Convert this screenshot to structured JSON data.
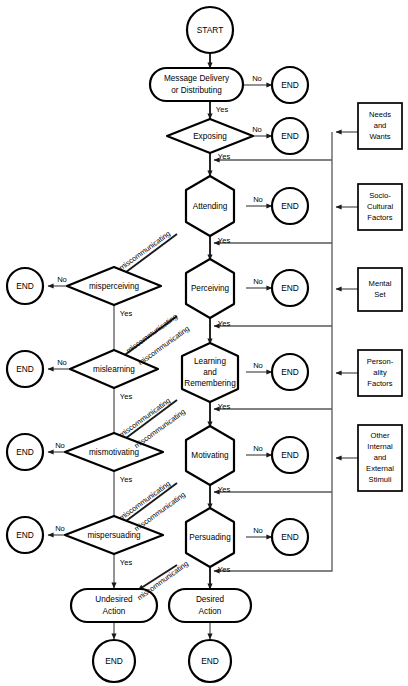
{
  "diagram": {
    "terminators": {
      "start_label": "START",
      "end_label": "END"
    },
    "answers": {
      "yes": "Yes",
      "no": "No"
    },
    "miscommunicating_label": "miscommunicating",
    "nodes": {
      "start": "START",
      "message_delivery": "Message Delivery\nor Distributing",
      "exposing": "Exposing",
      "attending": "Attending",
      "perceiving": "Perceiving",
      "learning": "Learning\nand\nRemembering",
      "motivating": "Motivating",
      "persuading": "Persuading",
      "misperceiving": "misperceiving",
      "mislearning": "mislearning",
      "mismotivating": "mismotivating",
      "mispersuading": "mispersuading",
      "undesired_action": "Undesired\nAction",
      "desired_action": "Desired\nAction"
    },
    "node_text": {
      "start": "START",
      "message_line1": "Message Delivery",
      "message_line2": "or Distributing",
      "exposing": "Exposing",
      "attending": "Attending",
      "perceiving": "Perceiving",
      "learning_line1": "Learning",
      "learning_line2": "and",
      "learning_line3": "Remembering",
      "motivating": "Motivating",
      "persuading": "Persuading",
      "misperceiving": "misperceiving",
      "mislearning": "mislearning",
      "mismotivating": "mismotivating",
      "mispersuading": "mispersuading",
      "undesired_line1": "Undesired",
      "undesired_line2": "Action",
      "desired_line1": "Desired",
      "desired_line2": "Action"
    },
    "side_boxes": [
      {
        "id": "needs-wants",
        "lines": [
          "Needs",
          "and",
          "Wants"
        ]
      },
      {
        "id": "socio-cultural",
        "lines": [
          "Socio-",
          "Cultural",
          "Factors"
        ]
      },
      {
        "id": "mental-set",
        "lines": [
          "Mental",
          "Set"
        ]
      },
      {
        "id": "personality",
        "lines": [
          "Person-",
          "ality",
          "Factors"
        ]
      },
      {
        "id": "other-stimuli",
        "lines": [
          "Other",
          "Internal",
          "and",
          "External",
          "Stimuli"
        ]
      }
    ],
    "side_box_text": {
      "b0l0": "Needs",
      "b0l1": "and",
      "b0l2": "Wants",
      "b1l0": "Socio-",
      "b1l1": "Cultural",
      "b1l2": "Factors",
      "b2l0": "Mental",
      "b2l1": "Set",
      "b3l0": "Person-",
      "b3l1": "ality",
      "b3l2": "Factors",
      "b4l0": "Other",
      "b4l1": "Internal",
      "b4l2": "and",
      "b4l3": "External",
      "b4l4": "Stimuli"
    },
    "end_labels": {
      "e1": "END",
      "e2": "END",
      "e3": "END",
      "e4": "END",
      "e5": "END",
      "e6": "END",
      "l1": "END",
      "l2": "END",
      "l3": "END",
      "l4": "END",
      "b1": "END",
      "b2": "END"
    },
    "yes_labels": {
      "y1": "Yes",
      "y2": "Yes",
      "y3": "Yes",
      "y4": "Yes",
      "y5": "Yes",
      "y6": "Yes",
      "y7": "Yes",
      "d1": "Yes",
      "d2": "Yes",
      "d3": "Yes",
      "d4": "Yes"
    },
    "no_labels": {
      "n1": "No",
      "n2": "No",
      "n3": "No",
      "n4": "No",
      "n5": "No",
      "n6": "No",
      "m1": "No",
      "m2": "No",
      "m3": "No",
      "m4": "No"
    },
    "mis_labels": {
      "m1": "miscommunicating",
      "m2": "miscommunicating",
      "m3": "miscommunicating",
      "m4": "miscommunicating",
      "m5": "miscommunicating",
      "m6": "miscommunicating",
      "m7": "miscommunicating",
      "m8": "miscommunicating"
    },
    "colors": {
      "stroke": "#000000",
      "connector": "#58595b",
      "background": "#ffffff"
    }
  }
}
